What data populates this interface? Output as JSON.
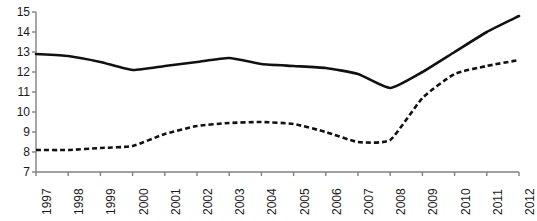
{
  "chart_data": {
    "type": "line",
    "title": "",
    "subtitle": "",
    "xlabel": "",
    "ylabel": "",
    "categories": [
      "1997",
      "1998",
      "1999",
      "2000",
      "2001",
      "2002",
      "2003",
      "2004",
      "2005",
      "2006",
      "2007",
      "2008",
      "2009",
      "2010",
      "2011",
      "2012"
    ],
    "x": [
      1997,
      1998,
      1999,
      2000,
      2001,
      2002,
      2003,
      2004,
      2005,
      2006,
      2007,
      2008,
      2009,
      2010,
      2011,
      2012
    ],
    "ylim": [
      7,
      15
    ],
    "yticks": [
      7,
      8,
      9,
      10,
      11,
      12,
      13,
      14,
      15
    ],
    "ytick_labels": [
      "7",
      "8",
      "9",
      "10",
      "11",
      "12",
      "13",
      "14",
      "15"
    ],
    "xtick_labels": [
      "1997",
      "1998",
      "1999",
      "2000",
      "2001",
      "2002",
      "2003",
      "2004",
      "2005",
      "2006",
      "2007",
      "2008",
      "2009",
      "2010",
      "2011",
      "2012"
    ],
    "grid": false,
    "legend": "none",
    "legend_position": "none",
    "annotations": [],
    "series": [
      {
        "name": "solid-series",
        "style": "solid",
        "color": "#111111",
        "line_width": 2.6,
        "values": [
          12.9,
          12.8,
          12.5,
          12.1,
          12.3,
          12.5,
          12.7,
          12.4,
          12.3,
          12.2,
          11.9,
          11.2,
          12.0,
          13.0,
          14.0,
          14.8
        ]
      },
      {
        "name": "dashed-series",
        "style": "dashed",
        "color": "#111111",
        "line_width": 2.6,
        "dash_pattern": "5,3",
        "values": [
          8.1,
          8.1,
          8.2,
          8.3,
          8.9,
          9.3,
          9.45,
          9.5,
          9.4,
          9.0,
          8.5,
          8.6,
          10.7,
          11.9,
          12.3,
          12.6
        ]
      }
    ],
    "axis": {
      "color": "#808080",
      "line_width": 1.4,
      "tick_color": "#808080",
      "tick_length": 4
    }
  }
}
